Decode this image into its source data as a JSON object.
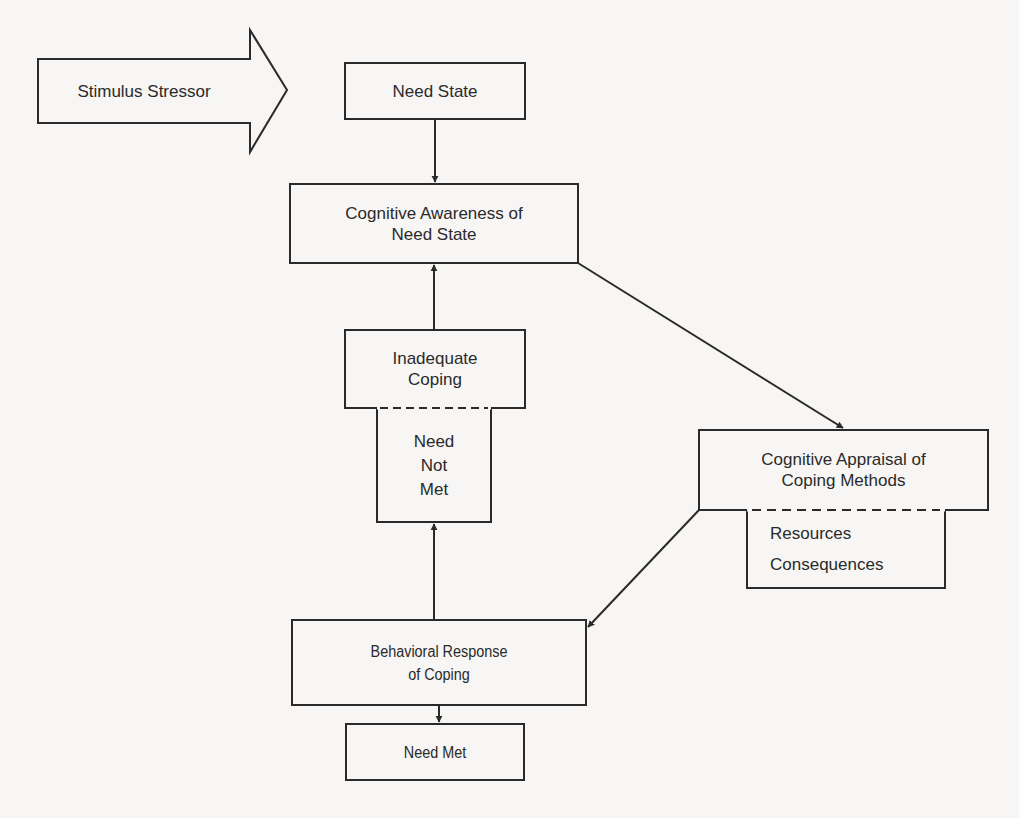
{
  "diagram": {
    "type": "flowchart",
    "title": "",
    "colors": {
      "stroke": "#2a2a2a",
      "background": "#f7f6f4",
      "text": "#2a2a2a"
    },
    "nodes": {
      "stimulus": {
        "id": "stimulus",
        "shape": "block-arrow",
        "lines": [
          "Stimulus Stressor"
        ]
      },
      "need_state": {
        "id": "need_state",
        "shape": "rect",
        "lines": [
          "Need State"
        ]
      },
      "cognitive_awareness": {
        "id": "cognitive_awareness",
        "shape": "rect",
        "lines": [
          "Cognitive Awareness of",
          "Need State"
        ]
      },
      "inadequate_coping": {
        "id": "inadequate_coping",
        "shape": "split-rect",
        "lines": [
          "Inadequate",
          "Coping"
        ],
        "sub_lines": [
          "Need",
          "Not",
          "Met"
        ]
      },
      "cognitive_appraisal": {
        "id": "cognitive_appraisal",
        "shape": "split-rect",
        "lines": [
          "Cognitive Appraisal of",
          "Coping Methods"
        ],
        "sub_lines": [
          "Resources",
          "Consequences"
        ]
      },
      "behavioral_response": {
        "id": "behavioral_response",
        "shape": "rect",
        "lines": [
          "Behavioral Response",
          "of Coping"
        ]
      },
      "need_met": {
        "id": "need_met",
        "shape": "rect",
        "lines": [
          "Need Met"
        ]
      }
    },
    "edges": [
      {
        "from": "stimulus",
        "to": "need_state",
        "style": "block-arrow"
      },
      {
        "from": "need_state",
        "to": "cognitive_awareness",
        "style": "arrow"
      },
      {
        "from": "cognitive_awareness",
        "to": "cognitive_appraisal",
        "style": "arrow"
      },
      {
        "from": "cognitive_appraisal",
        "to": "behavioral_response",
        "style": "arrow"
      },
      {
        "from": "behavioral_response",
        "to": "need_met",
        "style": "arrow"
      },
      {
        "from": "behavioral_response",
        "to": "inadequate_coping",
        "style": "arrow"
      },
      {
        "from": "inadequate_coping",
        "to": "cognitive_awareness",
        "style": "arrow"
      }
    ]
  }
}
